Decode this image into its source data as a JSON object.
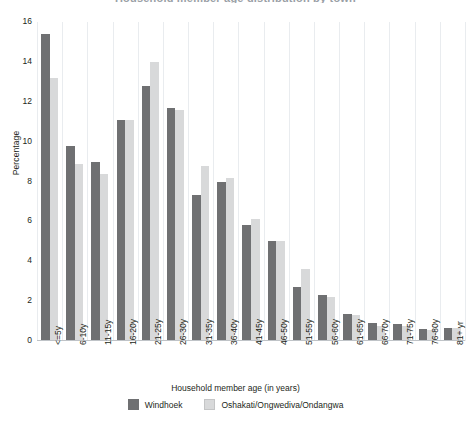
{
  "chart_data": {
    "type": "bar",
    "title": "Household member age distribution by town",
    "xlabel": "Household member age (in years)",
    "ylabel": "Percentage",
    "ylim": [
      0,
      16
    ],
    "yticks": [
      0,
      2,
      4,
      6,
      8,
      10,
      12,
      14,
      16
    ],
    "grid": "vertical",
    "legend_position": "bottom",
    "categories": [
      "<=5y",
      "6-10y",
      "11-15y",
      "16-20y",
      "21-25y",
      "26-30y",
      "31-35y",
      "36-40y",
      "41-45y",
      "46-50y",
      "51-55y",
      "56-60y",
      "61-65y",
      "66-70y",
      "71-75y",
      "76-80y",
      "81+ yr"
    ],
    "series": [
      {
        "name": "Windhoek",
        "color": "#6f7072",
        "values": [
          15.4,
          9.8,
          9.0,
          11.1,
          12.8,
          11.7,
          7.3,
          8.0,
          5.8,
          5.0,
          2.7,
          2.3,
          1.35,
          0.9,
          0.85,
          0.6,
          0.65
        ]
      },
      {
        "name": "Oshakati/Ongwediva/Ondangwa",
        "color": "#d8d9da",
        "values": [
          13.2,
          8.9,
          8.4,
          11.1,
          14.0,
          11.6,
          8.8,
          8.2,
          6.1,
          5.0,
          3.6,
          2.2,
          1.3,
          0.75,
          0.75,
          0.55,
          0.65
        ]
      }
    ]
  },
  "axis": {
    "y_title": "Percentage",
    "x_title": "Household member age (in years)"
  }
}
